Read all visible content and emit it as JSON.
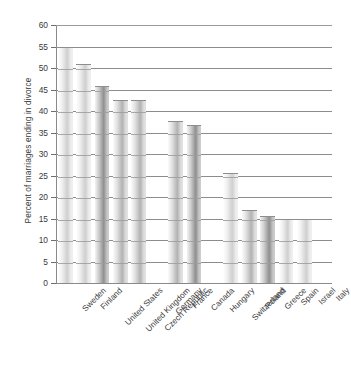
{
  "chart_data": {
    "type": "bar",
    "title": "",
    "xlabel": "",
    "ylabel": "Percent of marriages ending in divorce",
    "ylim": [
      0,
      60
    ],
    "ytick_step": 5,
    "yticks": [
      0,
      5,
      10,
      15,
      20,
      25,
      30,
      35,
      40,
      45,
      50,
      55,
      60
    ],
    "grid": "horizontal",
    "legend": "none",
    "categories": [
      "Sweden",
      "Finland",
      "United States",
      "United Kingdom",
      "Czech Republic",
      "Germany",
      "France",
      "Canada",
      "Hungary",
      "Switzerland",
      "Poland",
      "Greece",
      "Spain",
      "Israel",
      "Italy"
    ],
    "values": [
      55.0,
      50.9,
      45.8,
      42.6,
      42.6,
      null,
      37.6,
      36.8,
      null,
      25.5,
      16.9,
      15.7,
      15.0,
      14.8,
      null
    ],
    "bars": [
      {
        "label": "Sweden",
        "value": 55.0,
        "shade": "light"
      },
      {
        "label": "Finland",
        "value": 50.9,
        "shade": "light"
      },
      {
        "label": "United States",
        "value": 45.8,
        "shade": "dark"
      },
      {
        "label": "United Kingdom",
        "value": 42.6,
        "shade": "medium"
      },
      {
        "label": "Czech Republic",
        "value": 42.6,
        "shade": "medium"
      },
      {
        "label": "Germany",
        "value": null,
        "shade": "none"
      },
      {
        "label": "France",
        "value": 37.6,
        "shade": "medium"
      },
      {
        "label": "Canada",
        "value": 36.8,
        "shade": "dark"
      },
      {
        "label": "Hungary",
        "value": null,
        "shade": "none"
      },
      {
        "label": "Switzerland",
        "value": 25.5,
        "shade": "light"
      },
      {
        "label": "Poland",
        "value": 16.9,
        "shade": "medium"
      },
      {
        "label": "Greece",
        "value": 15.7,
        "shade": "dark"
      },
      {
        "label": "Spain",
        "value": 15.0,
        "shade": "light"
      },
      {
        "label": "Israel",
        "value": 14.8,
        "shade": "light"
      },
      {
        "label": "Italy",
        "value": null,
        "shade": "none"
      }
    ],
    "tick_labels_text": [
      "60",
      "55",
      "50",
      "45",
      "40",
      "35",
      "30",
      "25",
      "20",
      "15",
      "10",
      "5",
      "0"
    ]
  }
}
